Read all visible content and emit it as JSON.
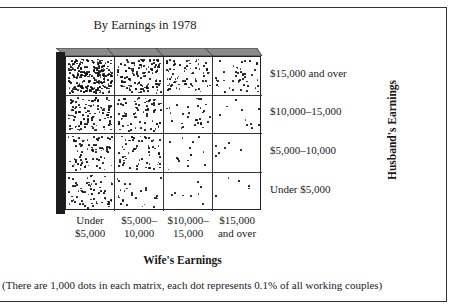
{
  "chart_data": {
    "type": "heatmap",
    "title": "By Earnings in 1978",
    "xlabel": "Wife's Earnings",
    "ylabel": "Husband's Earnings",
    "x_categories": [
      "Under $5,000",
      "$5,000–10,000",
      "$10,000–15,000",
      "$15,000 and over"
    ],
    "y_categories": [
      "$15,000 and over",
      "$10,000–15,000",
      "$5,000–10,000",
      "Under $5,000"
    ],
    "encoding": "dot density (1 dot = 0.1% of working couples)",
    "total_dots": 1000,
    "values": [
      [
        240,
        130,
        80,
        45
      ],
      [
        110,
        80,
        30,
        10
      ],
      [
        80,
        65,
        15,
        7
      ],
      [
        65,
        30,
        8,
        5
      ]
    ],
    "note": "(There are 1,000 dots in each matrix, each dot represents 0.1% of all working couples)"
  },
  "title": "By Earnings in 1978",
  "row_labels": [
    "$15,000 and over",
    "$10,000–15,000",
    "$5,000–10,000",
    "Under $5,000"
  ],
  "col_labels": [
    {
      "line1": "Under",
      "line2": "$5,000"
    },
    {
      "line1": "$5,000–",
      "line2": "10,000"
    },
    {
      "line1": "$10,000–",
      "line2": "15,000"
    },
    {
      "line1": "$15,000",
      "line2": "and over"
    }
  ],
  "xlabel": "Wife's Earnings",
  "ylabel": "Husband's Earnings",
  "footnote": "(There are 1,000 dots in each matrix, each dot represents 0.1% of all working couples)",
  "colors": {
    "dot": "#111111",
    "side": "#1c1c1c",
    "top_face": "#8a8a8a",
    "border": "#222222"
  }
}
